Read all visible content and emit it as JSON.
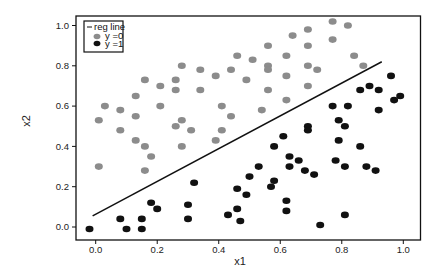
{
  "chart_data": {
    "type": "scatter",
    "title": "",
    "xlabel": "x1",
    "ylabel": "x2",
    "xlim": [
      -0.06,
      1.05
    ],
    "ylim": [
      -0.06,
      1.05
    ],
    "xticks": [
      0.0,
      0.2,
      0.4,
      0.6,
      0.8,
      1.0
    ],
    "xtick_labels": [
      "0.0",
      "0.2",
      "0.4",
      "0.6",
      "0.8",
      "1.0"
    ],
    "yticks": [
      0.0,
      0.2,
      0.4,
      0.6,
      0.8,
      1.0
    ],
    "ytick_labels": [
      "0.0",
      "0.2",
      "0.4",
      "0.6",
      "0.8",
      "1.0"
    ],
    "grid": false,
    "legend_position": "top-left",
    "legend": [
      {
        "label": "reg line",
        "symbol": "line",
        "color": "#111111"
      },
      {
        "label": "y =0",
        "symbol": "dot",
        "color": "#8c8c8c"
      },
      {
        "label": "y =1",
        "symbol": "dot",
        "color": "#111111"
      }
    ],
    "series": [
      {
        "name": "y =0",
        "color": "#8c8c8c",
        "points": [
          [
            0.77,
            1.02
          ],
          [
            0.82,
            1.0
          ],
          [
            0.69,
            0.98
          ],
          [
            0.64,
            0.95
          ],
          [
            0.77,
            0.93
          ],
          [
            0.56,
            0.9
          ],
          [
            0.69,
            0.9
          ],
          [
            0.46,
            0.85
          ],
          [
            0.62,
            0.85
          ],
          [
            0.84,
            0.85
          ],
          [
            0.51,
            0.83
          ],
          [
            0.28,
            0.8
          ],
          [
            0.56,
            0.8
          ],
          [
            0.69,
            0.8
          ],
          [
            0.87,
            0.8
          ],
          [
            0.34,
            0.78
          ],
          [
            0.44,
            0.78
          ],
          [
            0.56,
            0.78
          ],
          [
            0.72,
            0.78
          ],
          [
            0.39,
            0.75
          ],
          [
            0.62,
            0.75
          ],
          [
            0.16,
            0.73
          ],
          [
            0.26,
            0.73
          ],
          [
            0.49,
            0.73
          ],
          [
            0.21,
            0.7
          ],
          [
            0.69,
            0.7
          ],
          [
            0.26,
            0.68
          ],
          [
            0.34,
            0.68
          ],
          [
            0.56,
            0.68
          ],
          [
            0.13,
            0.65
          ],
          [
            0.62,
            0.63
          ],
          [
            0.03,
            0.6
          ],
          [
            0.21,
            0.6
          ],
          [
            0.41,
            0.6
          ],
          [
            0.08,
            0.58
          ],
          [
            0.54,
            0.58
          ],
          [
            0.13,
            0.55
          ],
          [
            0.44,
            0.55
          ],
          [
            0.01,
            0.53
          ],
          [
            0.28,
            0.53
          ],
          [
            0.26,
            0.5
          ],
          [
            0.08,
            0.48
          ],
          [
            0.31,
            0.48
          ],
          [
            0.41,
            0.48
          ],
          [
            0.13,
            0.43
          ],
          [
            0.39,
            0.43
          ],
          [
            0.16,
            0.4
          ],
          [
            0.28,
            0.4
          ],
          [
            0.18,
            0.35
          ],
          [
            0.01,
            0.3
          ],
          [
            0.16,
            0.28
          ]
        ]
      },
      {
        "name": "y =1",
        "color": "#111111",
        "points": [
          [
            0.96,
            0.75
          ],
          [
            0.89,
            0.7
          ],
          [
            0.86,
            0.68
          ],
          [
            0.92,
            0.68
          ],
          [
            0.99,
            0.65
          ],
          [
            0.97,
            0.63
          ],
          [
            0.77,
            0.6
          ],
          [
            0.82,
            0.6
          ],
          [
            0.92,
            0.58
          ],
          [
            0.79,
            0.53
          ],
          [
            0.81,
            0.5
          ],
          [
            0.69,
            0.5
          ],
          [
            0.69,
            0.48
          ],
          [
            0.61,
            0.45
          ],
          [
            0.79,
            0.43
          ],
          [
            0.86,
            0.4
          ],
          [
            0.58,
            0.4
          ],
          [
            0.63,
            0.35
          ],
          [
            0.66,
            0.33
          ],
          [
            0.78,
            0.33
          ],
          [
            0.63,
            0.3
          ],
          [
            0.53,
            0.3
          ],
          [
            0.81,
            0.3
          ],
          [
            0.88,
            0.3
          ],
          [
            0.68,
            0.28
          ],
          [
            0.91,
            0.28
          ],
          [
            0.71,
            0.26
          ],
          [
            0.5,
            0.25
          ],
          [
            0.58,
            0.23
          ],
          [
            0.32,
            0.22
          ],
          [
            0.57,
            0.2
          ],
          [
            0.46,
            0.19
          ],
          [
            0.49,
            0.16
          ],
          [
            0.3,
            0.11
          ],
          [
            0.62,
            0.13
          ],
          [
            0.18,
            0.12
          ],
          [
            0.2,
            0.09
          ],
          [
            0.62,
            0.08
          ],
          [
            0.46,
            0.09
          ],
          [
            0.43,
            0.06
          ],
          [
            0.81,
            0.06
          ],
          [
            0.08,
            0.04
          ],
          [
            0.15,
            0.04
          ],
          [
            0.3,
            0.04
          ],
          [
            0.47,
            0.03
          ],
          [
            0.73,
            0.01
          ],
          [
            -0.02,
            -0.01
          ],
          [
            0.1,
            -0.01
          ],
          [
            0.15,
            -0.01
          ]
        ]
      }
    ],
    "lines": [
      {
        "name": "reg line",
        "color": "#111111",
        "from": [
          -0.01,
          0.055
        ],
        "to": [
          0.93,
          0.82
        ]
      }
    ]
  }
}
